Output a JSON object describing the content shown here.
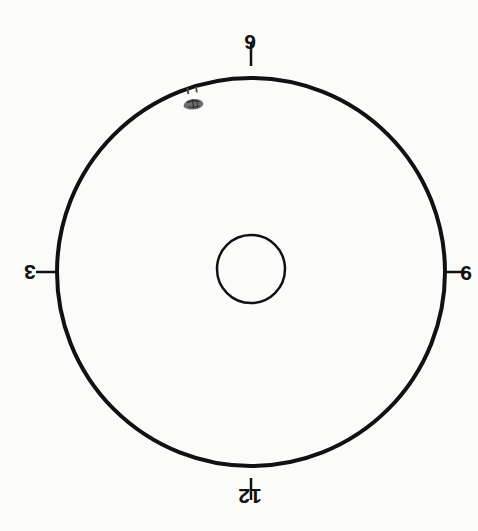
{
  "diagram": {
    "orientation_note": "inverted",
    "background_color": "#fbfbfa",
    "stroke_color": "#111111"
  },
  "dial": {
    "outer_circle": {
      "center_x": 251,
      "center_y": 272,
      "radius": 194,
      "stroke_width": 4
    },
    "hub_circle": {
      "center_x": 251,
      "center_y": 269,
      "radius": 34,
      "stroke_width": 2.5
    },
    "ticks": [
      {
        "name": "tick-top",
        "x1": 251,
        "y1": 66,
        "x2": 251,
        "y2": 42,
        "stroke_width": 2.5
      },
      {
        "name": "tick-right",
        "x1": 444,
        "y1": 272,
        "x2": 466,
        "y2": 272,
        "stroke_width": 2.5
      },
      {
        "name": "tick-bottom",
        "x1": 251,
        "y1": 478,
        "x2": 251,
        "y2": 500,
        "stroke_width": 2.5
      },
      {
        "name": "tick-left",
        "x1": 58,
        "y1": 272,
        "x2": 36,
        "y2": 272,
        "stroke_width": 2.5
      }
    ]
  },
  "labels": {
    "top": "9",
    "right": "6",
    "bottom": "12",
    "left": "3"
  },
  "hands": {
    "hour": null,
    "minute": null,
    "second": null
  },
  "annotation": {
    "smudge_color": "#6e6e6e",
    "smudge_label": "pencil-smudge"
  },
  "chart_data": {
    "type": "pie",
    "title": "",
    "xlabel": "",
    "ylabel": "",
    "categories": [
      "9",
      "6",
      "12",
      "3"
    ],
    "values": [
      0,
      0,
      0,
      0
    ],
    "tick_labels": [
      "9",
      "6",
      "12",
      "3"
    ],
    "tick_angles_deg": [
      270,
      0,
      90,
      180
    ],
    "legend": [],
    "grid": false
  }
}
